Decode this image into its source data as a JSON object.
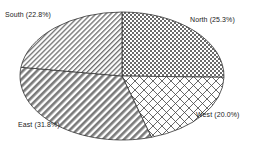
{
  "chart_data": {
    "type": "pie",
    "title": "",
    "start_angle": "12 o'clock",
    "direction": "clockwise",
    "categories": [
      "North",
      "West",
      "East",
      "South"
    ],
    "values": [
      25.3,
      20.0,
      31.8,
      22.8
    ],
    "labels": [
      "North (25.3%)",
      "West (20.0%)",
      "East (31.8%)",
      "South (22.8%)"
    ],
    "patterns": [
      "fine-checker",
      "diamond-crosshatch",
      "dense-diagonal-stripes",
      "thin-diagonal-stripes"
    ],
    "legend": "none (inline slice labels)"
  },
  "labels": {
    "north": "North (25.3%)",
    "west": "West (20.0%)",
    "east": "East (31.8%)",
    "south": "South (22.8%)"
  },
  "colors": {
    "stroke": "#333333",
    "pattern_ink": "#555555",
    "background": "#ffffff"
  }
}
